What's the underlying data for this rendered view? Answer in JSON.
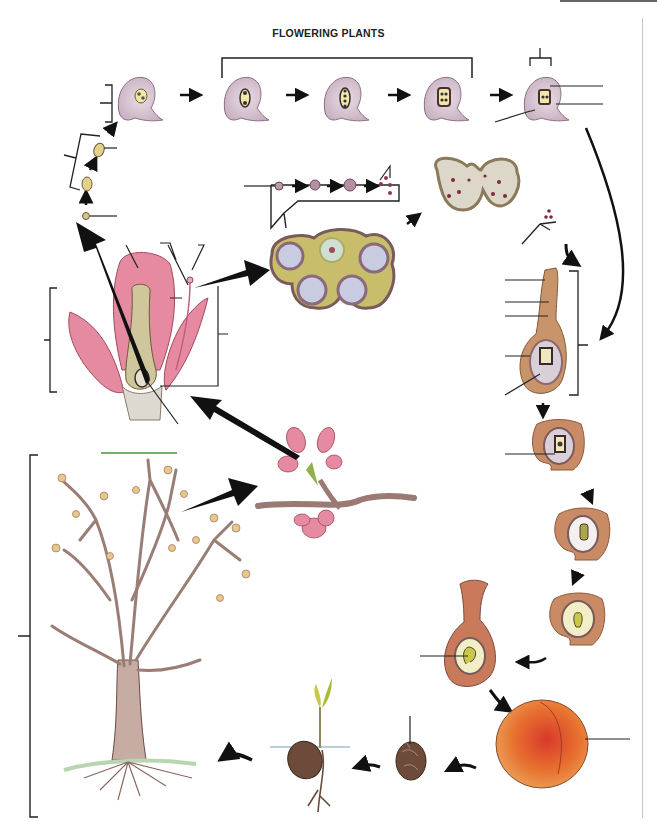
{
  "title": "FLOWERING PLANTS",
  "colors": {
    "ovule": "#d9c6d2",
    "embryo_sac": "#f1e7a8",
    "anther": "#c8bd6a",
    "petal": "#e58aa0",
    "carpel": "#cfc79b",
    "seed_wall": "#c98a66",
    "fruit": "#e8722f",
    "fruit_blush": "#d9452b",
    "pit": "#6d4a3a",
    "bark": "#b5998f",
    "arrow": "#111111",
    "leader_line": "#222222",
    "green_line": "#3c9a3c"
  },
  "diagram": {
    "stages": [
      {
        "id": "megaspore-mother-cell",
        "label": ""
      },
      {
        "id": "meiosis-dyad",
        "label": ""
      },
      {
        "id": "megaspore-tetrad",
        "label": ""
      },
      {
        "id": "ovule-2-nucleate",
        "label": ""
      },
      {
        "id": "ovule-4-nucleate",
        "label": ""
      },
      {
        "id": "ovule-8-nucleate",
        "label": ""
      },
      {
        "id": "mature-embryo-sac",
        "label": ""
      },
      {
        "id": "microspore-development",
        "label": ""
      },
      {
        "id": "anther-cross-section",
        "label": ""
      },
      {
        "id": "dehisced-anther",
        "label": ""
      },
      {
        "id": "germinating-pollen",
        "label": ""
      },
      {
        "id": "pistil-fertilization",
        "label": ""
      },
      {
        "id": "zygote-ovule",
        "label": ""
      },
      {
        "id": "embryo-early",
        "label": ""
      },
      {
        "id": "embryo-mid",
        "label": ""
      },
      {
        "id": "ovary-with-seed",
        "label": ""
      },
      {
        "id": "peach-fruit",
        "label": ""
      },
      {
        "id": "seed-pit",
        "label": ""
      },
      {
        "id": "seedling",
        "label": ""
      },
      {
        "id": "mature-tree",
        "label": ""
      },
      {
        "id": "flowering-branch",
        "label": ""
      },
      {
        "id": "flower-cross-section",
        "label": ""
      }
    ],
    "label_blanks_count": 26
  }
}
